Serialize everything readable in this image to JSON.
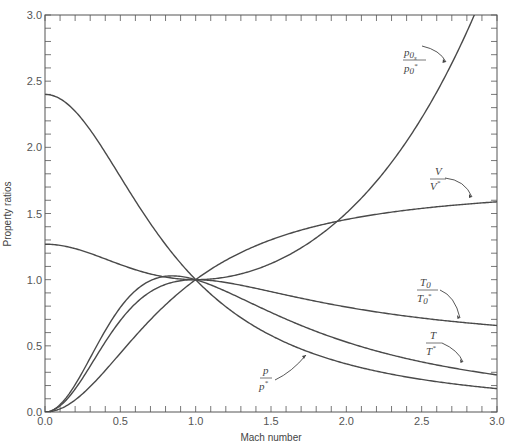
{
  "chart_data": {
    "type": "line",
    "title": "",
    "xlabel": "Mach number",
    "ylabel": "Property ratios",
    "xlim": [
      0.0,
      3.0
    ],
    "ylim": [
      0.0,
      3.0
    ],
    "x_ticks": [
      "0.0",
      "0.5",
      "1.0",
      "1.5",
      "2.0",
      "2.5",
      "3.0"
    ],
    "y_ticks": [
      "0.0",
      "0.5",
      "1.0",
      "1.5",
      "2.0",
      "2.5",
      "3.0"
    ],
    "grid": false,
    "legend": "inline annotations with arrows",
    "gamma": 1.4,
    "x": [
      0.0,
      0.25,
      0.5,
      0.75,
      1.0,
      1.5,
      2.0,
      2.5,
      3.0
    ],
    "series": [
      {
        "name": "p0/p0*",
        "key": "p0",
        "values": [
          2.4,
          2.22,
          1.78,
          1.3,
          1.0,
          0.88,
          1.5,
          2.22,
          3.42
        ]
      },
      {
        "name": "V/V*",
        "key": "V",
        "values": [
          0.0,
          0.14,
          0.43,
          0.79,
          1.0,
          1.32,
          1.48,
          1.56,
          1.61
        ]
      },
      {
        "name": "T0/T0*",
        "key": "T0",
        "values": [
          0.0,
          0.22,
          0.69,
          0.95,
          1.0,
          0.91,
          0.79,
          0.71,
          0.65
        ]
      },
      {
        "name": "T/T*",
        "key": "T",
        "values": [
          0.0,
          0.27,
          0.79,
          1.03,
          1.0,
          0.75,
          0.53,
          0.4,
          0.28
        ]
      },
      {
        "name": "p/p*",
        "key": "p",
        "values": [
          1.27,
          2.13,
          1.78,
          1.35,
          1.0,
          0.58,
          0.36,
          0.25,
          0.18
        ]
      }
    ],
    "annotations": [
      {
        "text_num": "p0s",
        "text_den": "p0*",
        "target": "p0/p0*"
      },
      {
        "text_num": "V",
        "text_den": "V*",
        "target": "V/V*"
      },
      {
        "text_num": "T0",
        "text_den": "T0*",
        "target": "T0/T0*"
      },
      {
        "text_num": "T",
        "text_den": "T*",
        "target": "T/T*"
      },
      {
        "text_num": "p",
        "text_den": "p*",
        "target": "p/p*"
      }
    ]
  },
  "labels": {
    "xlabel": "Mach number",
    "ylabel": "Property ratios"
  }
}
